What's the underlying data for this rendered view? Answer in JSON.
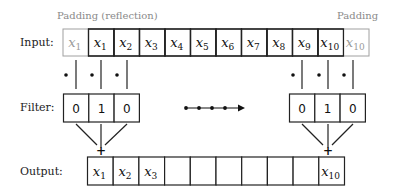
{
  "labels": {
    "input": "Input:",
    "filter": "Filter:",
    "output": "Output:"
  },
  "padding_notes": {
    "left": "Padding (reflection)",
    "right": "Padding"
  },
  "input_row": {
    "cells": [
      {
        "base": "x",
        "sub": "1",
        "padding": true
      },
      {
        "base": "x",
        "sub": "1",
        "padding": false
      },
      {
        "base": "x",
        "sub": "2",
        "padding": false
      },
      {
        "base": "x",
        "sub": "3",
        "padding": false
      },
      {
        "base": "x",
        "sub": "4",
        "padding": false
      },
      {
        "base": "x",
        "sub": "5",
        "padding": false
      },
      {
        "base": "x",
        "sub": "6",
        "padding": false
      },
      {
        "base": "x",
        "sub": "7",
        "padding": false
      },
      {
        "base": "x",
        "sub": "8",
        "padding": false
      },
      {
        "base": "x",
        "sub": "9",
        "padding": false
      },
      {
        "base": "x",
        "sub": "10",
        "padding": false
      },
      {
        "base": "x",
        "sub": "10",
        "padding": true
      }
    ]
  },
  "filter_left": {
    "values": [
      "0",
      "1",
      "0"
    ]
  },
  "filter_right": {
    "values": [
      "0",
      "1",
      "0"
    ]
  },
  "output_row": {
    "cells": [
      {
        "base": "x",
        "sub": "1"
      },
      {
        "base": "x",
        "sub": "2"
      },
      {
        "base": "x",
        "sub": "3"
      },
      {
        "base": "",
        "sub": ""
      },
      {
        "base": "",
        "sub": ""
      },
      {
        "base": "",
        "sub": ""
      },
      {
        "base": "",
        "sub": ""
      },
      {
        "base": "",
        "sub": ""
      },
      {
        "base": "",
        "sub": ""
      },
      {
        "base": "x",
        "sub": "10"
      }
    ]
  },
  "sum_symbol": "+",
  "dot_symbol": "•",
  "colors": {
    "stroke": "#222222",
    "padding_stroke": "#a0a0a0",
    "padding_text": "#9a9a9a",
    "note_text": "#8a8a8a"
  }
}
